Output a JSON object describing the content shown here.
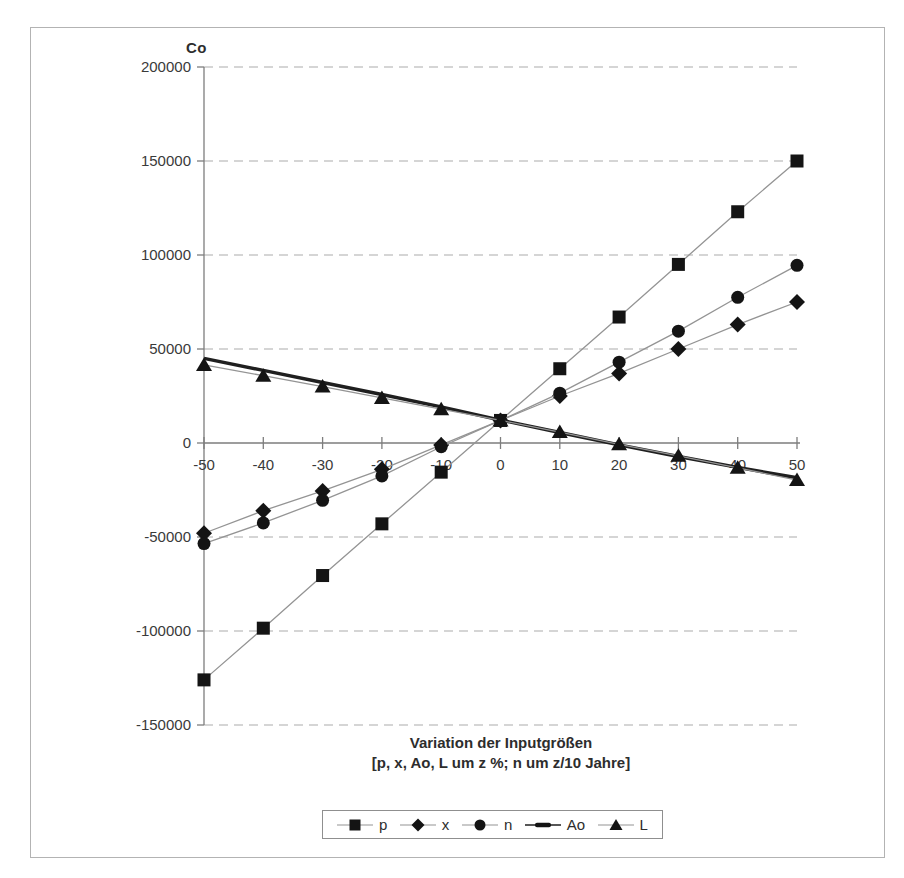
{
  "figure": {
    "y_axis_title": "Co",
    "x_axis_title_line1": "Variation der Inputgrößen",
    "x_axis_title_line2": "[p, x, Ao, L um z %; n um z/10 Jahre]"
  },
  "chart_data": {
    "type": "line",
    "title": "",
    "ylabel": "Co",
    "xlabel_line1": "Variation der Inputgrößen",
    "xlabel_line2": "[p, x, Ao, L um z %; n um z/10 Jahre]",
    "x": [
      -50,
      -40,
      -30,
      -20,
      -10,
      0,
      10,
      20,
      30,
      40,
      50
    ],
    "x_tick_labels": [
      "-50",
      "-40",
      "-30",
      "-20",
      "-10",
      "0",
      "10",
      "20",
      "30",
      "40",
      "50"
    ],
    "y_ticks": [
      200000,
      150000,
      100000,
      50000,
      0,
      -50000,
      -100000,
      -150000
    ],
    "y_tick_labels": [
      "200000",
      "150000",
      "100000",
      "50000",
      "0",
      "-50000",
      "-100000",
      "-150000"
    ],
    "ylim": [
      -150000,
      200000
    ],
    "xlim": [
      -50,
      50
    ],
    "grid": "horizontal-dashed",
    "legend_position": "bottom-center",
    "series": [
      {
        "name": "p",
        "marker": "square",
        "line": "thin",
        "values": [
          -126000,
          -98500,
          -70500,
          -43000,
          -15500,
          12000,
          39500,
          67000,
          95000,
          123000,
          150000
        ]
      },
      {
        "name": "x",
        "marker": "diamond",
        "line": "thin",
        "values": [
          -48000,
          -36000,
          -25500,
          -14000,
          -1000,
          12000,
          25000,
          37000,
          50000,
          63000,
          75000
        ]
      },
      {
        "name": "n",
        "marker": "circle",
        "line": "thin",
        "values": [
          -53500,
          -42500,
          -30500,
          -17500,
          -2000,
          12000,
          26500,
          43000,
          59500,
          77500,
          94500
        ]
      },
      {
        "name": "Ao",
        "marker": "thick-dash",
        "line": "thick",
        "values": [
          45000,
          38600,
          32200,
          25800,
          19200,
          12200,
          5600,
          -1000,
          -7200,
          -13000,
          -18500
        ]
      },
      {
        "name": "L",
        "marker": "triangle",
        "line": "thin",
        "values": [
          41500,
          35800,
          30000,
          24000,
          18000,
          12000,
          5800,
          -700,
          -6800,
          -13200,
          -19700
        ]
      }
    ],
    "colors": {
      "marker": "#141414",
      "thin_line": "#949494",
      "thick_line": "#1f1f1f",
      "grid": "#c7c7c7",
      "axis": "#7d7d7d",
      "text": "#3a3a3a"
    }
  }
}
